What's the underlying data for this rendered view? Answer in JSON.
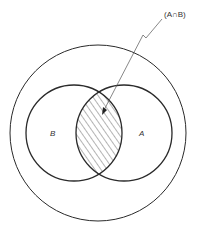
{
  "diagram": {
    "type": "venn",
    "universe_label": "",
    "sets": [
      {
        "id": "B",
        "label": "B"
      },
      {
        "id": "A",
        "label": "A"
      }
    ],
    "highlighted_region": "intersection",
    "annotation": "(A∩B)",
    "colors": {
      "stroke": "#2a2a2a",
      "hatch": "#444444",
      "background": "#ffffff"
    }
  }
}
